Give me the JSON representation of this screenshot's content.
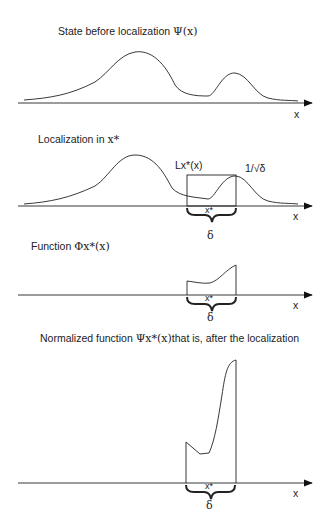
{
  "panels": [
    {
      "title": "State before localization",
      "title_symbol": "Ψ(x)",
      "axis_label": "x"
    },
    {
      "title": "Localization in",
      "title_symbol": "x*",
      "box_label": "Lx*(x)",
      "height_label": "1/√δ",
      "center_label": "x*",
      "width_label": "δ",
      "axis_label": "x"
    },
    {
      "title": "Function",
      "title_symbol": "Φx*(x)",
      "center_label": "x*",
      "width_label": "δ",
      "axis_label": "x"
    },
    {
      "title": "Normalized function",
      "title_symbol": "Ψx*(x)",
      "title_suffix": "that is, after the localization",
      "center_label": "x*",
      "width_label": "δ",
      "axis_label": "x"
    }
  ]
}
